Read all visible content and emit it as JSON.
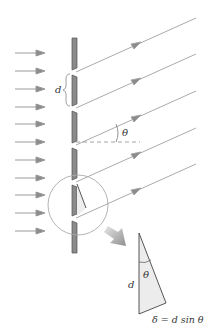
{
  "diagram": {
    "labels": {
      "slit_spacing": "d",
      "angle": "θ",
      "triangle_side": "d",
      "triangle_angle": "θ",
      "path_difference": "δ = d sin θ"
    },
    "colors": {
      "grating_fill": "#8a8a8a",
      "grating_edge": "#555555",
      "ray": "#9a9a9a",
      "arrowhead": "#8c8c8c",
      "incident_arrow": "#9a9a9a",
      "circle": "#aaaaaa",
      "triangle_fill": "#ededed",
      "triangle_edge": "#444444",
      "magnify_arrow": "#9c9c9c",
      "text": "#333333"
    },
    "elements": {
      "incident_waves": 11,
      "slits": 5,
      "diffracted_rays": 5
    }
  }
}
